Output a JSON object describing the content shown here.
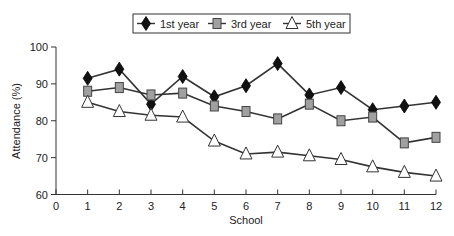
{
  "chart_data": {
    "type": "line",
    "title": "",
    "xlabel": "School",
    "ylabel": "Attendance (%)",
    "xlim": [
      0,
      12
    ],
    "ylim": [
      60,
      100
    ],
    "x_ticks": [
      0,
      1,
      2,
      3,
      4,
      5,
      6,
      7,
      8,
      9,
      10,
      11,
      12
    ],
    "y_ticks": [
      60,
      70,
      80,
      90,
      100
    ],
    "grid": false,
    "legend_position": "top-center, boxed, horizontal",
    "x": [
      1,
      2,
      3,
      4,
      5,
      6,
      7,
      8,
      9,
      10,
      11,
      12
    ],
    "series": [
      {
        "name": "1st year",
        "marker": "diamond",
        "marker_color": "#111111",
        "values": [
          91.5,
          94,
          84.5,
          92,
          86.5,
          89.5,
          95.5,
          87,
          89,
          83,
          84,
          85
        ]
      },
      {
        "name": "3rd year",
        "marker": "square",
        "marker_color": "#a0a0a0",
        "values": [
          88,
          89,
          87,
          87.5,
          84,
          82.5,
          80.5,
          84.5,
          80,
          81,
          74,
          75.5
        ]
      },
      {
        "name": "5th year",
        "marker": "triangle",
        "marker_color": "#ffffff",
        "values": [
          85,
          82.5,
          81.5,
          81,
          74.5,
          71,
          71.5,
          70.5,
          69.5,
          67.5,
          66,
          65
        ]
      }
    ]
  },
  "colors": {
    "line": "#333333",
    "axis": "#333333",
    "diamond_fill": "#111111",
    "square_fill": "#a0a0a0",
    "triangle_fill": "#ffffff"
  }
}
